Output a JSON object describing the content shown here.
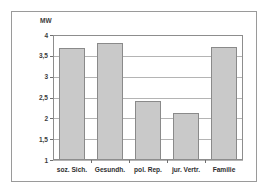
{
  "chart_data": {
    "type": "bar",
    "title": "",
    "subtitle": "",
    "xlabel": "",
    "ylabel": "MW",
    "categories": [
      "soz. Sich.",
      "Gesundh.",
      "pol. Rep.",
      "jur. Vertr.",
      "Familie"
    ],
    "values": [
      3.7,
      3.81,
      2.42,
      2.12,
      3.72
    ],
    "ylim": [
      1,
      4
    ],
    "ytick_labels": [
      "4",
      "3,5",
      "3",
      "2,5",
      "2",
      "1,5",
      "1"
    ],
    "ytick_values": [
      4,
      3.5,
      3,
      2.5,
      2,
      1.5,
      1
    ],
    "grid": true,
    "legend": null,
    "legend_position": "none",
    "series": [
      {
        "name": "MW",
        "values": [
          3.7,
          3.81,
          2.42,
          2.12,
          3.72
        ]
      }
    ],
    "bar_color": "#c9c9c9",
    "bar_border_color": "#8a8a8a",
    "grid_color": "#b4b4b4",
    "axis_color": "#8d8d8d"
  }
}
